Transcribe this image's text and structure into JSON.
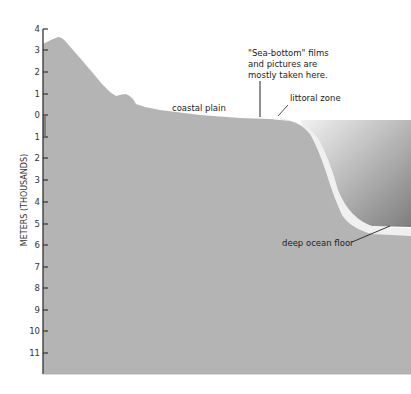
{
  "axis": {
    "title": "METERS (THOUSANDS)",
    "ticks": [
      "4",
      "3",
      "2",
      "1",
      "0",
      "1",
      "2",
      "3",
      "4",
      "5",
      "6",
      "7",
      "8",
      "9",
      "10",
      "11"
    ]
  },
  "labels": {
    "sea_bottom_line1": "\"Sea-bottom\" films",
    "sea_bottom_line2": "and pictures are",
    "sea_bottom_line3": "mostly taken here.",
    "coastal_plain": "coastal plain",
    "littoral_zone": "littoral zone",
    "deep_ocean_floor": "deep ocean floor"
  },
  "colors": {
    "land": "#b4b4b4",
    "sea_dark": "#8e8e8e",
    "sea_light": "#e6e6e6",
    "shelf_light": "#f2f2f2",
    "axis": "#333333"
  }
}
